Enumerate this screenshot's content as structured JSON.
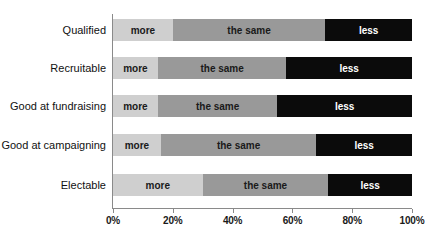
{
  "chart_data": {
    "type": "bar",
    "orientation": "horizontal",
    "stacked": true,
    "normalized": true,
    "title": "",
    "xlabel": "",
    "ylabel": "",
    "xlim": [
      0,
      100
    ],
    "grid": false,
    "legend_position": "none",
    "xticks": [
      "0%",
      "20%",
      "40%",
      "60%",
      "80%",
      "100%"
    ],
    "xtick_values": [
      0,
      20,
      40,
      60,
      80,
      100
    ],
    "categories": [
      "Qualified",
      "Recruitable",
      "Good at fundraising",
      "Good at campaigning",
      "Electable"
    ],
    "series": [
      {
        "name": "more",
        "color": "#cfcfcf",
        "values": [
          20,
          15,
          15,
          16,
          30
        ]
      },
      {
        "name": "the same",
        "color": "#999999",
        "values": [
          51,
          43,
          40,
          52,
          42
        ]
      },
      {
        "name": "less",
        "color": "#0b0b0b",
        "values": [
          29,
          42,
          45,
          32,
          28
        ]
      }
    ],
    "segment_labels": [
      [
        "more",
        "the same",
        "less"
      ],
      [
        "more",
        "the same",
        "less"
      ],
      [
        "more",
        "the same",
        "less"
      ],
      [
        "more",
        "the same",
        "less"
      ],
      [
        "more",
        "the same",
        "less"
      ]
    ]
  },
  "axis": {
    "ticks": [
      {
        "label": "0%",
        "value": 0
      },
      {
        "label": "20%",
        "value": 20
      },
      {
        "label": "40%",
        "value": 40
      },
      {
        "label": "60%",
        "value": 60
      },
      {
        "label": "80%",
        "value": 80
      },
      {
        "label": "100%",
        "value": 100
      }
    ]
  },
  "colors": {
    "more": "#cfcfcf",
    "same": "#999999",
    "less": "#0b0b0b",
    "axis": "#8a8a8a",
    "text": "#111111",
    "background": "#ffffff"
  }
}
